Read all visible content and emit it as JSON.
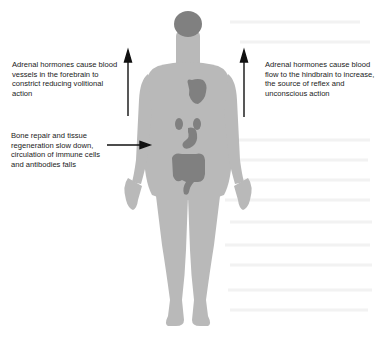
{
  "diagram": {
    "colors": {
      "background": "#ffffff",
      "body": "#b9b9b9",
      "organs": "#808080",
      "arrow": "#111111",
      "text": "#1a1a1a"
    },
    "annotations": {
      "left_top": "Adrenal hormones cause blood vessels in the forebrain to constrict reducing volitional action",
      "right_top": "Adrenal hormones cause blood flow to the hindbrain to increase, the source of reflex and unconscious action",
      "left_middle": "Bone repair and tissue regeneration slow down, circulation of immune cells and antibodies falls"
    },
    "arrows": [
      {
        "id": "arrow-left-up",
        "direction": "up"
      },
      {
        "id": "arrow-right-up",
        "direction": "up"
      },
      {
        "id": "arrow-left-to-body",
        "direction": "right"
      }
    ],
    "organs": [
      "brain",
      "heart",
      "kidneys",
      "stomach",
      "intestines"
    ]
  }
}
